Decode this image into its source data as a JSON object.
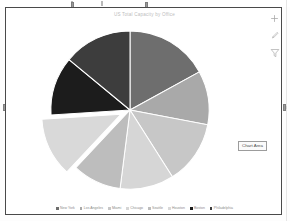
{
  "document": {
    "object_name": "embedded-chart-object",
    "selected": true
  },
  "chart_buttons": [
    {
      "name": "chart-elements-button",
      "icon": "plus-icon",
      "tooltip": "Chart Elements"
    },
    {
      "name": "chart-styles-button",
      "icon": "brush-icon",
      "tooltip": "Chart Styles"
    },
    {
      "name": "chart-filters-button",
      "icon": "funnel-icon",
      "tooltip": "Chart Filters"
    }
  ],
  "tooltip": {
    "label": "Chart Area"
  },
  "chart_data": {
    "type": "pie",
    "title": "US Total Capacity by Office",
    "xlabel": "",
    "ylabel": "",
    "legend_position": "bottom",
    "grid": false,
    "categories": [
      "New York",
      "Los Angeles",
      "Miami",
      "Chicago",
      "Seattle",
      "Houston",
      "Boston",
      "Philadelphia"
    ],
    "values": [
      17,
      11,
      13,
      11,
      10,
      12,
      12,
      14
    ],
    "colors": [
      "#6e6e6e",
      "#a9a9a9",
      "#c7c7c7",
      "#d6d6d6",
      "#bdbdbd",
      "#d9d9d9",
      "#1c1c1c",
      "#3d3d3d"
    ],
    "exploded_index": 5
  }
}
